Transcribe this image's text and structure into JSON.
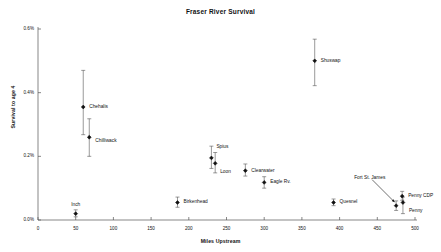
{
  "chart_data": {
    "type": "scatter",
    "title": "Fraser River Survival",
    "xlabel": "Miles Upstream",
    "ylabel": "Survival to age 4",
    "xlim": [
      0,
      500
    ],
    "ylim": [
      0.0,
      0.6
    ],
    "xticks": [
      0,
      50,
      100,
      150,
      200,
      250,
      300,
      350,
      400,
      450,
      500
    ],
    "xtick_labels": [
      "0",
      "50",
      "100",
      "150",
      "200",
      "250",
      "300",
      "350",
      "400",
      "450",
      "500"
    ],
    "yticks": [
      0.0,
      0.2,
      0.4,
      0.6
    ],
    "ytick_labels": [
      "0.0%",
      "0.2%",
      "0.4%",
      "0.6%"
    ],
    "grid": false,
    "legend": "none",
    "marker": "filled-diamond",
    "marker_color": "#111111",
    "errorbar_color": "#555555",
    "units": {
      "x": "miles",
      "y": "percent"
    },
    "points": [
      {
        "name": "Inch",
        "x": 50,
        "y": 0.02,
        "ylow": 0.01,
        "yhigh": 0.032,
        "label_dx": 0,
        "label_dy": -9,
        "label_align": "center",
        "leader": false
      },
      {
        "name": "Chehalis",
        "x": 60,
        "y": 0.355,
        "ylow": 0.268,
        "yhigh": 0.47,
        "label_dx": 6,
        "label_dy": 0,
        "label_align": "left",
        "leader": false
      },
      {
        "name": "Chilliwack",
        "x": 68,
        "y": 0.26,
        "ylow": 0.2,
        "yhigh": 0.318,
        "label_dx": 6,
        "label_dy": 4,
        "label_align": "left",
        "leader": false
      },
      {
        "name": "Birkenhead",
        "x": 185,
        "y": 0.055,
        "ylow": 0.04,
        "yhigh": 0.072,
        "label_dx": 6,
        "label_dy": 0,
        "label_align": "left",
        "leader": false
      },
      {
        "name": "Spius",
        "x": 230,
        "y": 0.195,
        "ylow": 0.162,
        "yhigh": 0.232,
        "label_dx": 5,
        "label_dy": -11,
        "label_align": "left",
        "leader": false
      },
      {
        "name": "Loon",
        "x": 235,
        "y": 0.178,
        "ylow": 0.148,
        "yhigh": 0.212,
        "label_dx": 5,
        "label_dy": 9,
        "label_align": "left",
        "leader": false
      },
      {
        "name": "Clearwater",
        "x": 275,
        "y": 0.155,
        "ylow": 0.138,
        "yhigh": 0.176,
        "label_dx": 6,
        "label_dy": 0,
        "label_align": "left",
        "leader": false
      },
      {
        "name": "Eagle Rv.",
        "x": 300,
        "y": 0.118,
        "ylow": 0.1,
        "yhigh": 0.136,
        "label_dx": 6,
        "label_dy": 0,
        "label_align": "left",
        "leader": false
      },
      {
        "name": "Shuswap",
        "x": 367,
        "y": 0.5,
        "ylow": 0.422,
        "yhigh": 0.568,
        "label_dx": 6,
        "label_dy": 0,
        "label_align": "left",
        "leader": false
      },
      {
        "name": "Quesnel",
        "x": 392,
        "y": 0.055,
        "ylow": 0.045,
        "yhigh": 0.066,
        "label_dx": 6,
        "label_dy": 0,
        "label_align": "left",
        "leader": false
      },
      {
        "name": "Fort St. James",
        "x": 475,
        "y": 0.045,
        "ylow": 0.03,
        "yhigh": 0.06,
        "label_dx": -42,
        "label_dy": -28,
        "label_align": "left",
        "leader": true
      },
      {
        "name": "Penny CDP",
        "x": 483,
        "y": 0.075,
        "ylow": 0.062,
        "yhigh": 0.09,
        "label_dx": 6,
        "label_dy": 0,
        "label_align": "left",
        "leader": false
      },
      {
        "name": "Penny",
        "x": 484,
        "y": 0.055,
        "ylow": 0.02,
        "yhigh": 0.072,
        "label_dx": 6,
        "label_dy": 9,
        "label_align": "left",
        "leader": false
      }
    ]
  },
  "colors": {
    "axis": "#555555",
    "marker": "#111111",
    "text": "#111111",
    "background": "#ffffff"
  }
}
